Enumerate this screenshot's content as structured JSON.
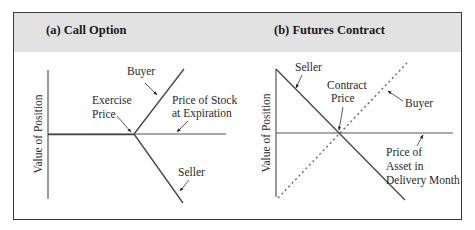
{
  "figure": {
    "panels": [
      {
        "id": "a",
        "title": "(a) Call Option",
        "y_axis_label": "Value of Position",
        "x_axis_label_line1": "Price of Stock",
        "x_axis_label_line2": "at Expiration",
        "kink_label_line1": "Exercise",
        "kink_label_line2": "Price",
        "buyer_label": "Buyer",
        "seller_label": "Seller"
      },
      {
        "id": "b",
        "title": "(b) Futures Contract",
        "y_axis_label": "Value of Position",
        "x_axis_label_line1": "Price of",
        "x_axis_label_line2": "Asset in",
        "x_axis_label_line3": "Delivery Month",
        "cross_label_line1": "Contract",
        "cross_label_line2": "Price",
        "buyer_label": "Buyer",
        "seller_label": "Seller"
      }
    ]
  },
  "colors": {
    "header_bg": "#e2e2e2",
    "border": "#3a3a3a",
    "line": "#444444"
  }
}
